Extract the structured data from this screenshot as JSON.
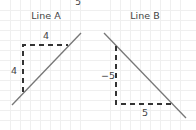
{
  "top_label": "5",
  "panels": [
    {
      "title": "Line A",
      "rise_label": "4",
      "run_label": "4",
      "slope_direction": "positive"
    },
    {
      "title": "Line B",
      "rise_label": "−5",
      "run_label": "5",
      "slope_direction": "negative"
    }
  ],
  "colors": {
    "line": "#777777",
    "dash": "#333333",
    "grid": "#eeeeee",
    "text": "#444444"
  }
}
